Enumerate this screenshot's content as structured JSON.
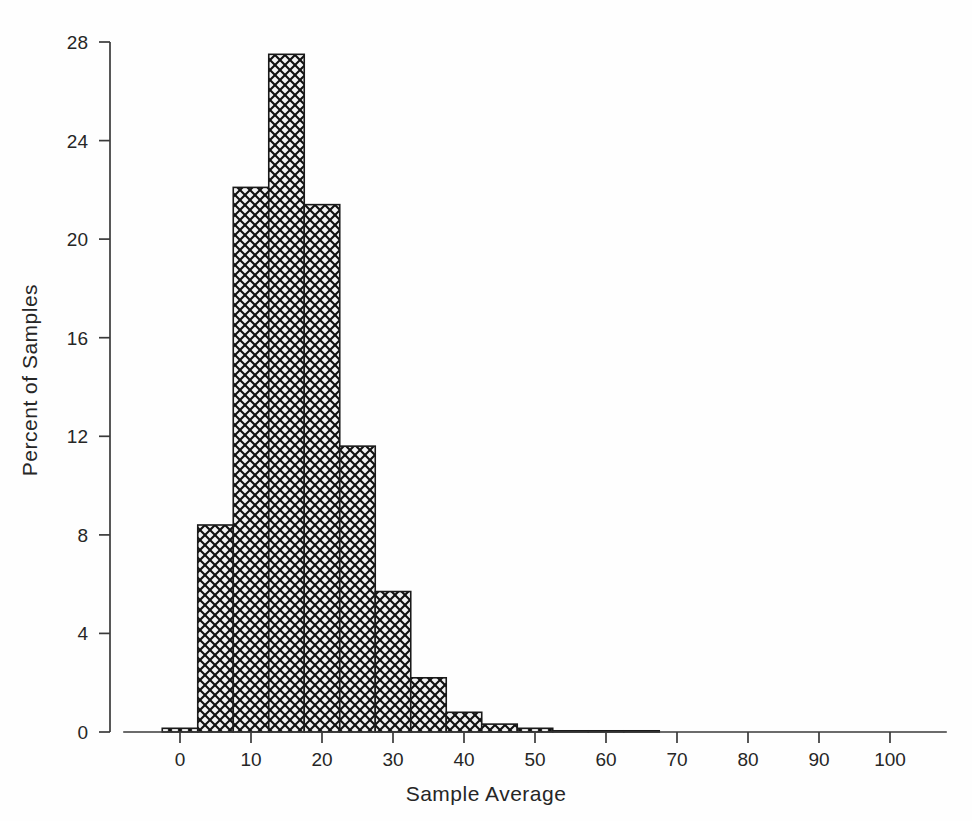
{
  "chart_data": {
    "type": "bar",
    "title": "",
    "subtitle": "",
    "xlabel": "Sample Average",
    "ylabel": "Percent of Samples",
    "xlim": [
      -6,
      111
    ],
    "ylim": [
      0,
      28
    ],
    "grid": false,
    "legend": null,
    "bin_width": 5,
    "bar_fill": "#f0f0f0",
    "bar_edge": "#1a1a1a",
    "hatch": "crosshatch",
    "axis_color": "#3a3a3a",
    "xticks": [
      0,
      10,
      20,
      30,
      40,
      50,
      60,
      70,
      80,
      90,
      100
    ],
    "xtick_labels": [
      "0",
      "10",
      "20",
      "30",
      "40",
      "50",
      "60",
      "70",
      "80",
      "90",
      "100"
    ],
    "yticks": [
      0,
      4,
      8,
      12,
      16,
      20,
      24,
      28
    ],
    "ytick_labels": [
      "0",
      "4",
      "8",
      "12",
      "16",
      "20",
      "24",
      "28"
    ],
    "bins": [
      {
        "left": -2.5,
        "right": 2.5,
        "center": 0,
        "value": 0.15
      },
      {
        "left": 2.5,
        "right": 7.5,
        "center": 5,
        "value": 8.4
      },
      {
        "left": 7.5,
        "right": 12.5,
        "center": 10,
        "value": 22.1
      },
      {
        "left": 12.5,
        "right": 17.5,
        "center": 15,
        "value": 27.5
      },
      {
        "left": 17.5,
        "right": 22.5,
        "center": 20,
        "value": 21.4
      },
      {
        "left": 22.5,
        "right": 27.5,
        "center": 25,
        "value": 11.6
      },
      {
        "left": 27.5,
        "right": 32.5,
        "center": 30,
        "value": 5.7
      },
      {
        "left": 32.5,
        "right": 37.5,
        "center": 35,
        "value": 2.2
      },
      {
        "left": 37.5,
        "right": 42.5,
        "center": 40,
        "value": 0.8
      },
      {
        "left": 42.5,
        "right": 47.5,
        "center": 45,
        "value": 0.32
      },
      {
        "left": 47.5,
        "right": 52.5,
        "center": 50,
        "value": 0.15
      },
      {
        "left": 52.5,
        "right": 57.5,
        "center": 55,
        "value": 0.03
      },
      {
        "left": 57.5,
        "right": 62.5,
        "center": 60,
        "value": 0.02
      },
      {
        "left": 62.5,
        "right": 67.5,
        "center": 65,
        "value": 0.01
      }
    ],
    "categories": [
      "0",
      "5",
      "10",
      "15",
      "20",
      "25",
      "30",
      "35",
      "40",
      "45",
      "50",
      "55",
      "60",
      "65"
    ],
    "values": [
      0.15,
      8.4,
      22.1,
      27.5,
      21.4,
      11.6,
      5.7,
      2.2,
      0.8,
      0.32,
      0.15,
      0.03,
      0.02,
      0.01
    ]
  }
}
